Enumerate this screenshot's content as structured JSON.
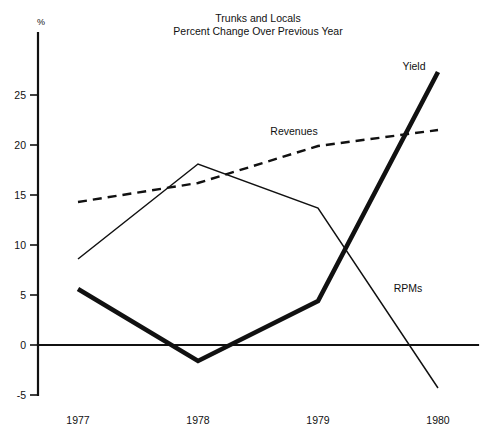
{
  "chart_data": {
    "type": "line",
    "title": "Trunks and Locals",
    "subtitle": "Percent Change Over Previous Year",
    "xlabel": "",
    "ylabel": "%",
    "y_unit_symbol": "%",
    "categories": [
      "1977",
      "1978",
      "1979",
      "1980"
    ],
    "x": [
      1977,
      1978,
      1979,
      1980
    ],
    "xlim": [
      1977,
      1980
    ],
    "ylim": [
      -5,
      28
    ],
    "yticks": [
      -5,
      0,
      5,
      10,
      15,
      20,
      25
    ],
    "ytick_labels": [
      "-5",
      "0",
      "5",
      "10",
      "15",
      "20",
      "25"
    ],
    "xtick_labels": [
      "1977",
      "1978",
      "1979",
      "1980"
    ],
    "grid": false,
    "legend": "inline-annotations",
    "zero_line": true,
    "series": [
      {
        "name": "Yield",
        "style": "thick-solid",
        "label": "Yield",
        "values": [
          5.6,
          -1.6,
          4.4,
          27.3
        ]
      },
      {
        "name": "RPMs",
        "style": "thin-solid",
        "label": "RPMs",
        "values": [
          8.6,
          18.1,
          13.7,
          -4.3
        ]
      },
      {
        "name": "Revenues",
        "style": "dashed",
        "label": "Revenues",
        "values": [
          14.3,
          16.2,
          19.9,
          21.5
        ]
      }
    ],
    "annotations": [
      {
        "text": "Yield",
        "x": 1979.63,
        "y": 25.9
      },
      {
        "text": "Revenues",
        "x": 1978.72,
        "y": 20.2
      },
      {
        "text": "RPMs",
        "x": 1979.73,
        "y": 5.3
      },
      {
        "text": "%",
        "x": 1977.0,
        "y": 28.8
      }
    ]
  }
}
